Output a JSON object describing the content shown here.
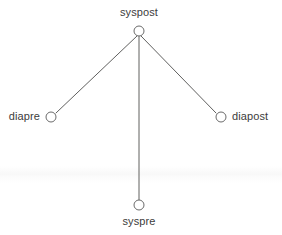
{
  "diagram": {
    "type": "star-graph",
    "background_color": "#ffffff",
    "edge_color": "#60605f",
    "edge_width": 1,
    "node_stroke_color": "#6a6a6a",
    "node_fill_color": "#ffffff",
    "node_radius": 5,
    "label_color": "#3c3c3c",
    "nodes": [
      {
        "id": "syspost",
        "label": "syspost",
        "x": 139,
        "y": 31,
        "label_x": 139,
        "label_y": 13,
        "label_anchor": "above"
      },
      {
        "id": "diapre",
        "label": "diapre",
        "x": 51,
        "y": 117,
        "label_x": 40,
        "label_y": 117,
        "label_anchor": "left"
      },
      {
        "id": "diapost",
        "label": "diapost",
        "x": 221,
        "y": 117,
        "label_x": 232,
        "label_y": 117,
        "label_anchor": "right"
      },
      {
        "id": "syspre",
        "label": "syspre",
        "x": 139,
        "y": 205,
        "label_x": 139,
        "label_y": 222,
        "label_anchor": "below"
      }
    ],
    "edges": [
      {
        "id": "edge-syspost-diapre",
        "from": "syspost",
        "to": "diapre",
        "x1": 137,
        "y1": 36,
        "x2": 56,
        "y2": 113
      },
      {
        "id": "edge-syspost-syspre",
        "from": "syspost",
        "to": "syspre",
        "x1": 139,
        "y1": 36,
        "x2": 139,
        "y2": 200
      },
      {
        "id": "edge-syspost-diapost",
        "from": "syspost",
        "to": "diapost",
        "x1": 141,
        "y1": 36,
        "x2": 216,
        "y2": 113
      }
    ]
  }
}
